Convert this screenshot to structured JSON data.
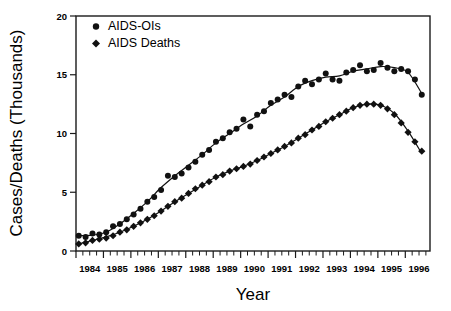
{
  "chart_data": {
    "type": "scatter",
    "title": "",
    "xlabel": "Year",
    "ylabel": "Cases/Deaths (Thousands)",
    "xlim": [
      1984.0,
      1996.9
    ],
    "ylim": [
      0,
      20
    ],
    "yticks": [
      0,
      5,
      10,
      15,
      20
    ],
    "xticks": [
      1984,
      1985,
      1986,
      1987,
      1988,
      1989,
      1990,
      1991,
      1992,
      1993,
      1994,
      1995,
      1996
    ],
    "xtick_labels": [
      "1984",
      "1985",
      "1986",
      "1987",
      "1988",
      "1989",
      "1990",
      "1991",
      "1992",
      "1993",
      "1994",
      "1995",
      "1996"
    ],
    "x_minor_ticks_per_year": 4,
    "grid": false,
    "legend_position": "top-left",
    "marker_note": "AIDS-OIs drawn as filled circles; AIDS Deaths drawn as filled diamonds; each series overlaid with a smoothed trend line",
    "series": [
      {
        "name": "AIDS-OIs",
        "marker": "circle",
        "color": "#111111",
        "x": [
          1984.1,
          1984.35,
          1984.6,
          1984.85,
          1985.1,
          1985.35,
          1985.6,
          1985.85,
          1986.1,
          1986.35,
          1986.6,
          1986.85,
          1987.1,
          1987.35,
          1987.6,
          1987.85,
          1988.1,
          1988.35,
          1988.6,
          1988.85,
          1989.1,
          1989.35,
          1989.6,
          1989.85,
          1990.1,
          1990.35,
          1990.6,
          1990.85,
          1991.1,
          1991.35,
          1991.6,
          1991.85,
          1992.1,
          1992.35,
          1992.6,
          1992.85,
          1993.1,
          1993.35,
          1993.6,
          1993.85,
          1994.1,
          1994.35,
          1994.6,
          1994.85,
          1995.1,
          1995.35,
          1995.6,
          1995.85,
          1996.1,
          1996.35,
          1996.6
        ],
        "y": [
          1.3,
          1.2,
          1.5,
          1.4,
          1.6,
          2.1,
          2.3,
          2.7,
          3.1,
          3.6,
          4.2,
          4.6,
          5.2,
          6.4,
          6.3,
          6.6,
          7.1,
          7.6,
          8.2,
          8.6,
          9.3,
          9.6,
          10.1,
          10.4,
          11.2,
          10.6,
          11.6,
          11.9,
          12.6,
          12.9,
          13.3,
          13.1,
          14.0,
          14.5,
          14.2,
          14.6,
          15.1,
          14.6,
          14.5,
          15.2,
          15.4,
          15.8,
          15.3,
          15.4,
          16.0,
          15.6,
          15.3,
          15.5,
          15.3,
          14.6,
          13.3
        ]
      },
      {
        "name": "AIDS Deaths",
        "marker": "diamond",
        "color": "#111111",
        "x": [
          1984.1,
          1984.35,
          1984.6,
          1984.85,
          1985.1,
          1985.35,
          1985.6,
          1985.85,
          1986.1,
          1986.35,
          1986.6,
          1986.85,
          1987.1,
          1987.35,
          1987.6,
          1987.85,
          1988.1,
          1988.35,
          1988.6,
          1988.85,
          1989.1,
          1989.35,
          1989.6,
          1989.85,
          1990.1,
          1990.35,
          1990.6,
          1990.85,
          1991.1,
          1991.35,
          1991.6,
          1991.85,
          1992.1,
          1992.35,
          1992.6,
          1992.85,
          1993.1,
          1993.35,
          1993.6,
          1993.85,
          1994.1,
          1994.35,
          1994.6,
          1994.85,
          1995.1,
          1995.35,
          1995.6,
          1995.85,
          1996.1,
          1996.35,
          1996.6
        ],
        "y": [
          0.6,
          0.7,
          0.9,
          1.0,
          1.1,
          1.3,
          1.6,
          1.8,
          2.1,
          2.4,
          2.7,
          3.0,
          3.4,
          3.8,
          4.2,
          4.5,
          4.9,
          5.3,
          5.6,
          5.9,
          6.3,
          6.5,
          6.8,
          7.0,
          7.2,
          7.4,
          7.7,
          8.0,
          8.3,
          8.6,
          8.9,
          9.2,
          9.6,
          9.9,
          10.3,
          10.6,
          11.0,
          11.3,
          11.6,
          11.9,
          12.2,
          12.4,
          12.5,
          12.5,
          12.4,
          12.1,
          11.6,
          10.9,
          10.1,
          9.3,
          8.5
        ]
      }
    ],
    "trend_lines": [
      {
        "name": "AIDS-OIs-trend",
        "x": [
          1984.1,
          1984.6,
          1985.1,
          1985.6,
          1986.1,
          1986.6,
          1987.1,
          1987.6,
          1988.1,
          1988.6,
          1989.1,
          1989.6,
          1990.1,
          1990.6,
          1991.1,
          1991.6,
          1992.1,
          1992.6,
          1993.1,
          1993.6,
          1994.1,
          1994.6,
          1995.1,
          1995.6,
          1996.1,
          1996.6
        ],
        "y": [
          1.3,
          1.35,
          1.6,
          2.3,
          3.2,
          4.2,
          5.4,
          6.4,
          7.3,
          8.2,
          9.2,
          10.0,
          10.8,
          11.5,
          12.4,
          13.1,
          14.0,
          14.5,
          14.8,
          14.9,
          15.3,
          15.5,
          15.7,
          15.6,
          15.2,
          13.4
        ]
      },
      {
        "name": "AIDS-Deaths-trend",
        "x": [
          1984.1,
          1984.6,
          1985.1,
          1985.6,
          1986.1,
          1986.6,
          1987.1,
          1987.6,
          1988.1,
          1988.6,
          1989.1,
          1989.6,
          1990.1,
          1990.6,
          1991.1,
          1991.6,
          1992.1,
          1992.6,
          1993.1,
          1993.6,
          1994.1,
          1994.6,
          1995.1,
          1995.6,
          1996.1,
          1996.6
        ],
        "y": [
          0.6,
          0.9,
          1.2,
          1.6,
          2.1,
          2.7,
          3.4,
          4.2,
          4.9,
          5.6,
          6.3,
          6.8,
          7.2,
          7.7,
          8.3,
          8.9,
          9.6,
          10.3,
          11.0,
          11.6,
          12.2,
          12.5,
          12.4,
          11.7,
          10.2,
          8.3
        ]
      }
    ]
  },
  "legend": {
    "items": [
      {
        "label": "AIDS-OIs",
        "marker": "circle"
      },
      {
        "label": "AIDS Deaths",
        "marker": "diamond"
      }
    ]
  }
}
